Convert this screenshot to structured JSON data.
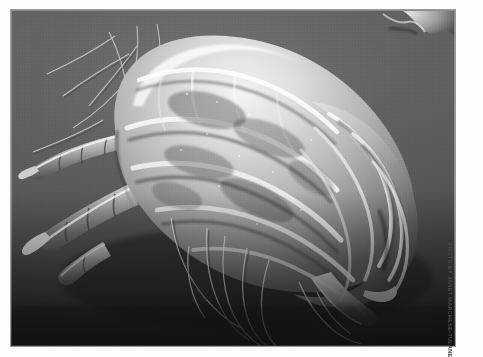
{
  "page": {
    "background_color": "#ffffff",
    "margin_color": "#fdfdfd"
  },
  "photo": {
    "caption_credit": "Photo by Janet Marchese-Tulane Photoshop",
    "subject": "House dust mite",
    "technique": "Scanning electron micrograph",
    "palette": {
      "background_gray": "#5a5a5a",
      "deep_shadow": "#1e1e1e",
      "mid_tone": "#8a8a8a",
      "highlight": "#f2f2f2",
      "cuticle_bright": "#e8e8e8",
      "border_gray": "#9a9a9a"
    },
    "frame": {
      "left": 11,
      "top": 10,
      "width": 444,
      "height": 336
    },
    "features": [
      {
        "name": "idiosoma",
        "label": "Body (idiosoma)"
      },
      {
        "name": "cuticle-folds",
        "label": "Folded cuticle striations"
      },
      {
        "name": "legs",
        "label": "Segmented legs"
      },
      {
        "name": "setae",
        "label": "Long trailing setae"
      },
      {
        "name": "debris-particle",
        "label": "Debris fragment"
      },
      {
        "name": "substrate",
        "label": "Substrate surface"
      }
    ]
  }
}
